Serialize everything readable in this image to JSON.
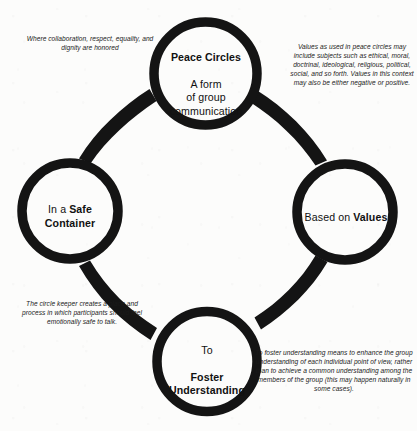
{
  "diagram": {
    "background_color": "#fcfcfb",
    "ink_color": "#111111",
    "nodes": [
      {
        "id": "peace-circles",
        "position": "top",
        "heading": "Peace Circles",
        "body": "A form\nof group\ncommunication",
        "full_text": "Peace Circles A form of group communication"
      },
      {
        "id": "based-on-values",
        "position": "right",
        "prefix": "Based on ",
        "heading": "Values",
        "full_text": "Based on Values"
      },
      {
        "id": "in-a-safe-container",
        "position": "left",
        "prefix": "In a ",
        "heading": "Safe\nContainer",
        "full_text": "In a Safe Container"
      },
      {
        "id": "to-foster-understanding",
        "position": "bottom",
        "prefix": "To",
        "heading": "Foster\nUnderstanding",
        "full_text": "To Foster Understanding"
      }
    ],
    "annotations": [
      {
        "id": "safe-container-values",
        "anchor": "top-left",
        "text": "Where collaboration, respect, equality, and dignity are honored"
      },
      {
        "id": "values-explanation",
        "anchor": "top-right",
        "text": "Values as used in peace circles may include subjects such as ethical, moral, doctrinal, ideological, religious, political, social, and so forth. Values in this context may also be either negative or positive."
      },
      {
        "id": "circle-keeper-role",
        "anchor": "bottom-left",
        "text": "The circle keeper creates a place and process in which participants should feel emotionally safe to talk."
      },
      {
        "id": "foster-understanding-explanation",
        "anchor": "bottom-right",
        "text": "To foster understanding means to enhance the group understanding of each individual point of view, rather than to achieve a common understanding among the members of the group (this may happen naturally in some cases)."
      }
    ],
    "connectors": [
      {
        "id": "connector-top-to-left",
        "from": "peace-circles",
        "to": "in-a-safe-container"
      },
      {
        "id": "connector-top-to-right",
        "from": "peace-circles",
        "to": "based-on-values"
      },
      {
        "id": "connector-right-to-bottom",
        "from": "based-on-values",
        "to": "to-foster-understanding"
      },
      {
        "id": "connector-left-to-bottom",
        "from": "in-a-safe-container",
        "to": "to-foster-understanding"
      }
    ]
  }
}
